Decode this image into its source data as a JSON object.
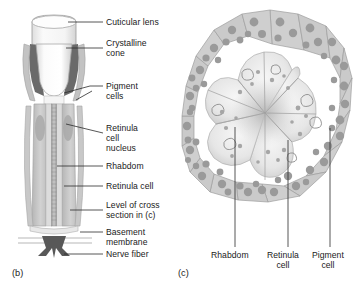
{
  "figure": {
    "panels": [
      {
        "id": "b",
        "caption": "(b)",
        "title": "Longitudinal section of an ommatidium"
      },
      {
        "id": "c",
        "caption": "(c)",
        "title": "Cross section of an ommatidium"
      }
    ]
  },
  "panel_b": {
    "caption": "(b)",
    "labels": [
      {
        "key": "cuticular_lens",
        "text": "Cuticular lens"
      },
      {
        "key": "crystalline_cone",
        "text": "Crystalline\ncone"
      },
      {
        "key": "pigment_cells",
        "text": "Pigment\ncells"
      },
      {
        "key": "retinula_cell_nucleus",
        "text": "Retinula\ncell\nnucleus"
      },
      {
        "key": "rhabdom",
        "text": "Rhabdom"
      },
      {
        "key": "retinula_cell",
        "text": "Retinula cell"
      },
      {
        "key": "level_of_cross_section",
        "text": "Level of cross\nsection in (c)"
      },
      {
        "key": "basement_membrane",
        "text": "Basement\nmembrane"
      },
      {
        "key": "nerve_fiber",
        "text": "Nerve fiber"
      }
    ]
  },
  "panel_c": {
    "caption": "(c)",
    "labels": [
      {
        "key": "rhabdom",
        "text": "Rhabdom"
      },
      {
        "key": "retinula_cell",
        "text": "Retinula\ncell"
      },
      {
        "key": "pigment_cell",
        "text": "Pigment\ncell"
      }
    ]
  },
  "colors": {
    "background": "#ffffff",
    "outline": "#8d8d8d",
    "leader_line": "#2b2b2b",
    "lens_fill": "#f2f2f2",
    "cone_fill": "#fbfbfb",
    "pigment_dark": "#646464",
    "pigment_cell_fill": "#cfcfcf",
    "pigment_granule": "#9a9a9a",
    "retinula_fill": "#c6c6c6",
    "retinula_pale": "#eaeaea",
    "rhabdom_fill": "#b4b4b4",
    "nerve_fill": "#555555",
    "text": "#1a1a1a"
  }
}
